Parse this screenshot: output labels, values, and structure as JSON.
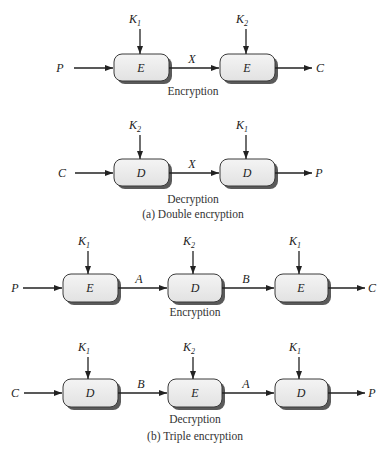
{
  "diagram": {
    "double": {
      "caption": "(a) Double encryption",
      "encryption": {
        "label": "Encryption",
        "input": "P",
        "output": "C",
        "boxes": [
          {
            "op": "E",
            "key": "K",
            "key_sub": "1"
          },
          {
            "op": "E",
            "key": "K",
            "key_sub": "2"
          }
        ],
        "links": [
          "X"
        ]
      },
      "decryption": {
        "label": "Decryption",
        "input": "C",
        "output": "P",
        "boxes": [
          {
            "op": "D",
            "key": "K",
            "key_sub": "2"
          },
          {
            "op": "D",
            "key": "K",
            "key_sub": "1"
          }
        ],
        "links": [
          "X"
        ]
      }
    },
    "triple": {
      "caption": "(b) Triple encryption",
      "encryption": {
        "label": "Encryption",
        "input": "P",
        "output": "C",
        "boxes": [
          {
            "op": "E",
            "key": "K",
            "key_sub": "1"
          },
          {
            "op": "D",
            "key": "K",
            "key_sub": "2"
          },
          {
            "op": "E",
            "key": "K",
            "key_sub": "1"
          }
        ],
        "links": [
          "A",
          "B"
        ]
      },
      "decryption": {
        "label": "Decryption",
        "input": "C",
        "output": "P",
        "boxes": [
          {
            "op": "D",
            "key": "K",
            "key_sub": "1"
          },
          {
            "op": "E",
            "key": "K",
            "key_sub": "2"
          },
          {
            "op": "D",
            "key": "K",
            "key_sub": "1"
          }
        ],
        "links": [
          "B",
          "A"
        ]
      }
    }
  }
}
